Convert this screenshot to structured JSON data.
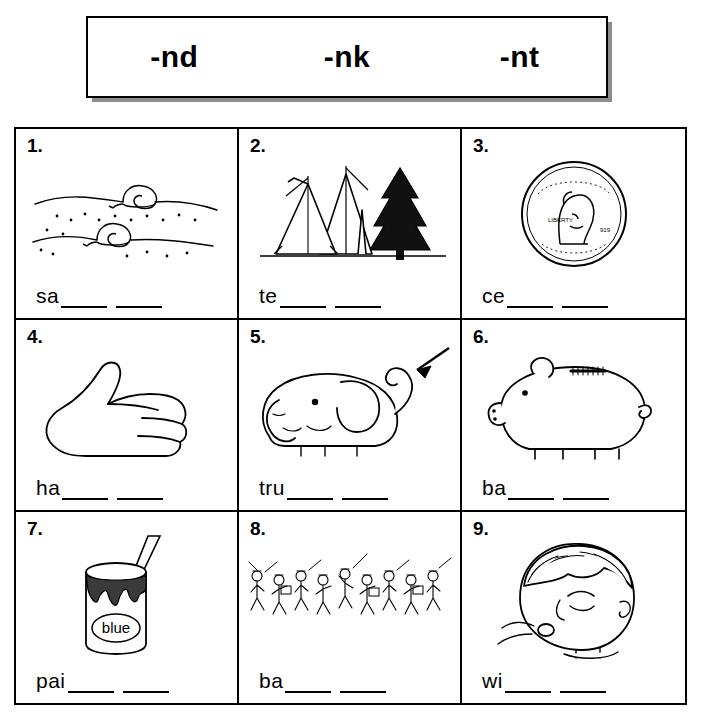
{
  "header": {
    "parts": [
      "-nd",
      "-nk",
      "-nt"
    ]
  },
  "worksheet": {
    "items": [
      {
        "number": "1.",
        "stem": "sa",
        "picture": "snail-on-sand",
        "blanks": 2
      },
      {
        "number": "2.",
        "stem": "te",
        "picture": "tent-with-tree",
        "blanks": 2
      },
      {
        "number": "3.",
        "stem": "ce",
        "picture": "penny-coin",
        "blanks": 2
      },
      {
        "number": "4.",
        "stem": "ha",
        "picture": "hand",
        "blanks": 2
      },
      {
        "number": "5.",
        "stem": "tru",
        "picture": "elephant-trunk-with-arrow",
        "blanks": 2
      },
      {
        "number": "6.",
        "stem": "ba",
        "picture": "piggy-bank",
        "blanks": 2
      },
      {
        "number": "7.",
        "stem": "pai",
        "picture": "paint-can-labeled-blue",
        "blanks": 2
      },
      {
        "number": "8.",
        "stem": "ba",
        "picture": "marching-band",
        "blanks": 2
      },
      {
        "number": "9.",
        "stem": "wi",
        "picture": "face-blowing-wind",
        "blanks": 2
      }
    ],
    "paint_can_label": "blue"
  }
}
